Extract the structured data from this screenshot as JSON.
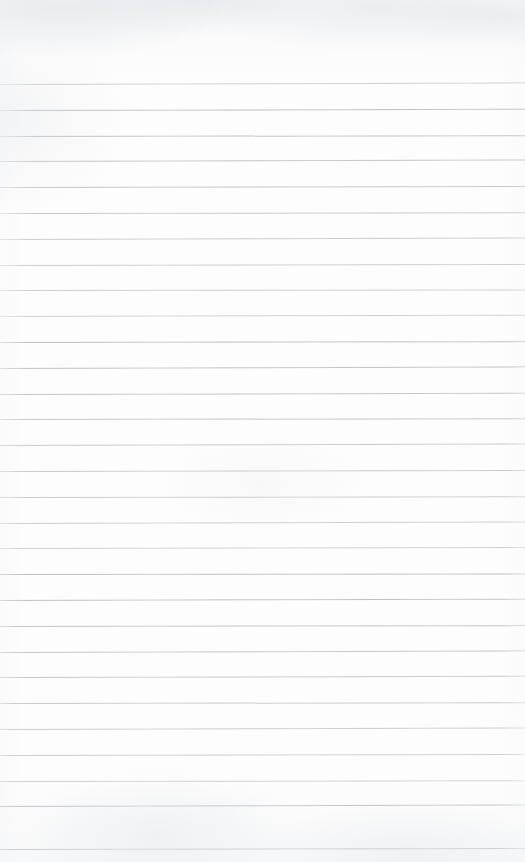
{
  "document": {
    "kind": "scanned-notebook-page",
    "description": "Blank scanned ruled notebook page with no handwriting or printed text",
    "page_width": 525,
    "page_height": 862,
    "content_text": "",
    "handwriting": "",
    "printed_text": ""
  },
  "paper": {
    "background_color": "#fdfdfd",
    "edge_tint_color": "#e8eaee",
    "texture": "subtle scan mottling, lighter toward center"
  },
  "ruling": {
    "style": "wide-ruled horizontal lines",
    "line_color": "#b9bcc2",
    "line_thickness_px": 1,
    "first_line_y": 84,
    "line_spacing_px": 25.8,
    "line_count": 30,
    "left_inset_px": 0,
    "right_inset_px": 0,
    "margin_rule_present": "none",
    "skew_deg": -0.12,
    "lines": [
      {
        "index": 1,
        "y": 84
      },
      {
        "index": 2,
        "y": 110
      },
      {
        "index": 3,
        "y": 136
      },
      {
        "index": 4,
        "y": 161
      },
      {
        "index": 5,
        "y": 187
      },
      {
        "index": 6,
        "y": 213
      },
      {
        "index": 7,
        "y": 239
      },
      {
        "index": 8,
        "y": 265
      },
      {
        "index": 9,
        "y": 290
      },
      {
        "index": 10,
        "y": 316
      },
      {
        "index": 11,
        "y": 342
      },
      {
        "index": 12,
        "y": 368
      },
      {
        "index": 13,
        "y": 394
      },
      {
        "index": 14,
        "y": 419
      },
      {
        "index": 15,
        "y": 445
      },
      {
        "index": 16,
        "y": 471
      },
      {
        "index": 17,
        "y": 497
      },
      {
        "index": 18,
        "y": 523
      },
      {
        "index": 19,
        "y": 548
      },
      {
        "index": 20,
        "y": 574
      },
      {
        "index": 21,
        "y": 600
      },
      {
        "index": 22,
        "y": 626
      },
      {
        "index": 23,
        "y": 652
      },
      {
        "index": 24,
        "y": 677
      },
      {
        "index": 25,
        "y": 703
      },
      {
        "index": 26,
        "y": 729
      },
      {
        "index": 27,
        "y": 755
      },
      {
        "index": 28,
        "y": 781
      },
      {
        "index": 29,
        "y": 806
      },
      {
        "index": 30,
        "y": 849
      }
    ]
  },
  "regions": {
    "top_margin": {
      "label": "top blank margin",
      "y": 0,
      "height": 84
    },
    "writing_area": {
      "label": "ruled writing area",
      "y": 84,
      "height": 765
    },
    "bottom_margin": {
      "label": "bottom blank margin",
      "y": 849,
      "height": 13
    }
  }
}
